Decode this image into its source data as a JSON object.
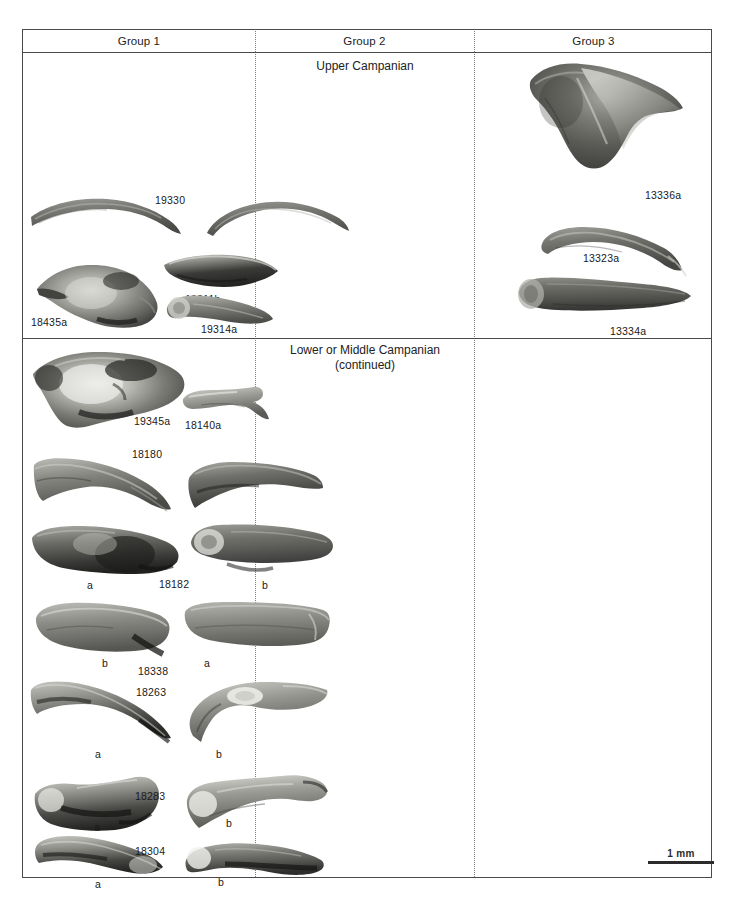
{
  "figure": {
    "type": "fossil-specimen-plate",
    "background_color": "#ffffff",
    "frame_color": "#4a4a4a",
    "divider_style": "dotted"
  },
  "columns": [
    {
      "id": "group1",
      "label": "Group 1"
    },
    {
      "id": "group2",
      "label": "Group 2"
    },
    {
      "id": "group3",
      "label": "Group 3"
    }
  ],
  "sections": [
    {
      "id": "upper",
      "stage_title": "Upper Campanian",
      "continued_note": ""
    },
    {
      "id": "lower",
      "stage_title": "Lower or Middle Campanian",
      "continued_note": "(continued)"
    }
  ],
  "specimens": {
    "upper": {
      "group1": [
        {
          "id": "19330",
          "label": "19330",
          "views": []
        },
        {
          "id": "19311b",
          "label": "19311b",
          "views": []
        },
        {
          "id": "18435a",
          "label": "18435a",
          "views": []
        },
        {
          "id": "19314a",
          "label": "19314a",
          "views": []
        }
      ],
      "group2": [],
      "group3": [
        {
          "id": "13336a",
          "label": "13336a",
          "views": []
        },
        {
          "id": "13323a",
          "label": "13323a",
          "views": []
        },
        {
          "id": "13334a",
          "label": "13334a",
          "views": []
        }
      ]
    },
    "lower": {
      "group1": [
        {
          "id": "19345a",
          "label": "19345a",
          "views": []
        },
        {
          "id": "18140a",
          "label": "18140a",
          "views": []
        },
        {
          "id": "18180",
          "label": "18180",
          "views": []
        },
        {
          "id": "18182",
          "label": "18182",
          "views": [
            "a",
            "b"
          ]
        },
        {
          "id": "18338",
          "label": "18338",
          "views": [
            "b",
            "a"
          ]
        },
        {
          "id": "18263",
          "label": "18263",
          "views": [
            "a",
            "b"
          ]
        },
        {
          "id": "18283",
          "label": "18283",
          "views": [
            "a",
            "b"
          ]
        },
        {
          "id": "18304",
          "label": "18304",
          "views": [
            "a",
            "b"
          ]
        }
      ],
      "group2": [],
      "group3": []
    }
  },
  "labels": {
    "spec_19330": "19330",
    "spec_19311b": "19311b",
    "spec_18435a": "18435a",
    "spec_19314a": "19314a",
    "spec_13336a": "13336a",
    "spec_13323a": "13323a",
    "spec_13334a": "13334a",
    "spec_19345a": "19345a",
    "spec_18140a": "18140a",
    "spec_18180": "18180",
    "spec_18182": "18182",
    "spec_18338": "18338",
    "spec_18263": "18263",
    "spec_18283": "18283",
    "spec_18304": "18304",
    "view_a": "a",
    "view_b": "b"
  },
  "scale": {
    "text": "1 mm",
    "bar_length_px": 66
  }
}
